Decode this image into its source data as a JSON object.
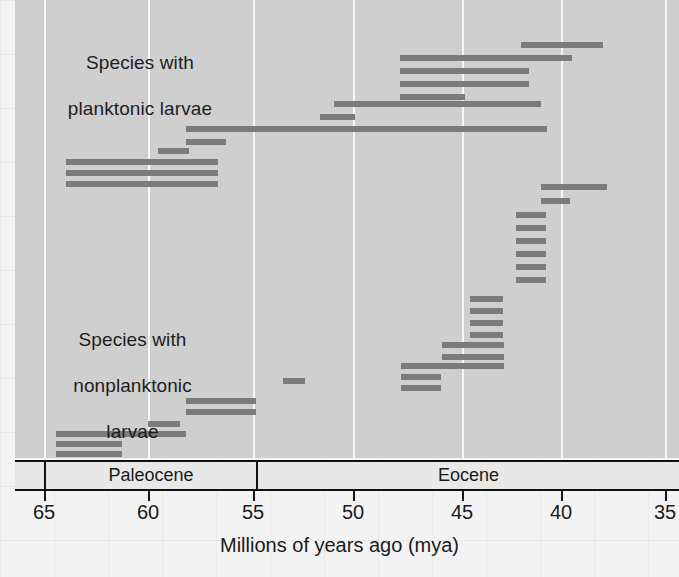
{
  "chart_data": {
    "type": "bar",
    "title": "",
    "xlabel": "Millions of years ago (mya)",
    "ylabel": "",
    "xlim": [
      67.0,
      34.3
    ],
    "x_reversed": true,
    "grid": true,
    "legend_position": "none",
    "tick_values": [
      65,
      60,
      55,
      50,
      45,
      40,
      35
    ],
    "tick_labels": [
      "65",
      "60",
      "55",
      "50",
      "45",
      "40",
      "35"
    ],
    "epochs": [
      {
        "label": "Paleocene",
        "start": 65.5,
        "end": 55.8
      },
      {
        "label": "Eocene",
        "start": 55.8,
        "end": 33.9
      }
    ],
    "group_labels": [
      {
        "text": "Species with\nplanktonic larvae",
        "x_center": 60.2,
        "y_px": 52
      },
      {
        "text": "Species with\nnonplanktonic\nlarvae",
        "x_center": 60.4,
        "y_px": 332
      }
    ],
    "series": [
      {
        "name": "Species with planktonic larvae",
        "bars": [
          {
            "start": 42.1,
            "end": 38.1,
            "row": 0
          },
          {
            "start": 45.9,
            "end": 41.7,
            "row": 1
          },
          {
            "start": 45.9,
            "end": 43.3,
            "row": 2
          },
          {
            "start": 45.9,
            "end": 43.3,
            "row": 3
          },
          {
            "start": 45.9,
            "end": 44.5,
            "row": 4
          },
          {
            "start": 49.0,
            "end": 41.3,
            "row": 5
          },
          {
            "start": 49.6,
            "end": 48.3,
            "row": 6
          },
          {
            "start": 57.3,
            "end": 49.4,
            "row": 7
          },
          {
            "start": 57.9,
            "end": 56.4,
            "row": 8
          },
          {
            "start": 58.9,
            "end": 57.6,
            "row": 9
          },
          {
            "start": 63.6,
            "end": 55.9,
            "row": 10
          },
          {
            "start": 63.7,
            "end": 55.9,
            "row": 11
          },
          {
            "start": 63.8,
            "end": 55.9,
            "row": 12
          }
        ]
      },
      {
        "name": "Species with nonplanktonic larvae",
        "bars": [
          {
            "start": 39.5,
            "end": 37.5,
            "row": 0
          },
          {
            "start": 39.5,
            "end": 38.5,
            "row": 1
          },
          {
            "start": 39.5,
            "end": 38.5,
            "row": 2
          },
          {
            "start": 39.5,
            "end": 38.5,
            "row": 3
          },
          {
            "start": 39.5,
            "end": 38.5,
            "row": 4
          },
          {
            "start": 41.8,
            "end": 40.7,
            "row": 5
          },
          {
            "start": 41.8,
            "end": 40.7,
            "row": 6
          },
          {
            "start": 41.8,
            "end": 40.7,
            "row": 7
          },
          {
            "start": 41.8,
            "end": 40.7,
            "row": 8
          },
          {
            "start": 41.8,
            "end": 40.7,
            "row": 9
          },
          {
            "start": 41.8,
            "end": 40.7,
            "row": 10
          },
          {
            "start": 41.8,
            "end": 40.7,
            "row": 11
          },
          {
            "start": 44.2,
            "end": 41.9,
            "row": 12
          },
          {
            "start": 44.2,
            "end": 41.9,
            "row": 13
          },
          {
            "start": 44.2,
            "end": 41.9,
            "row": 14
          },
          {
            "start": 44.2,
            "end": 41.9,
            "row": 15
          },
          {
            "start": 45.3,
            "end": 42.0,
            "row": 16
          },
          {
            "start": 45.3,
            "end": 42.0,
            "row": 17
          },
          {
            "start": 46.7,
            "end": 42.0,
            "row": 18
          },
          {
            "start": 46.7,
            "end": 44.8,
            "row": 19
          },
          {
            "start": 46.7,
            "end": 44.8,
            "row": 20
          },
          {
            "start": 53.0,
            "end": 52.0,
            "row": 21
          },
          {
            "start": 58.3,
            "end": 56.3,
            "row": 22
          },
          {
            "start": 58.3,
            "end": 56.3,
            "row": 23
          },
          {
            "start": 59.7,
            "end": 58.7,
            "row": 24
          },
          {
            "start": 64.1,
            "end": 59.0,
            "row": 25
          },
          {
            "start": 64.1,
            "end": 61.8,
            "row": 26
          },
          {
            "start": 64.1,
            "end": 61.8,
            "row": 27
          }
        ]
      }
    ],
    "bar_rows_px": {
      "planktonic": [
        45,
        58,
        70,
        82,
        94,
        101,
        113,
        126,
        144,
        156,
        168
      ],
      "nonplanktonic": []
    },
    "bar_color": "#7b7b7b",
    "plot_background": "#cfcfcf"
  },
  "bars_px": [
    {
      "left": 521,
      "width": 82,
      "top": 42
    },
    {
      "left": 400,
      "width": 172,
      "top": 55
    },
    {
      "left": 400,
      "width": 129,
      "top": 68
    },
    {
      "left": 400,
      "width": 129,
      "top": 81
    },
    {
      "left": 400,
      "width": 65,
      "top": 94
    },
    {
      "left": 334,
      "width": 207,
      "top": 101
    },
    {
      "left": 320,
      "width": 35,
      "top": 114
    },
    {
      "left": 186,
      "width": 361,
      "top": 126
    },
    {
      "left": 186,
      "width": 40,
      "top": 139
    },
    {
      "left": 158,
      "width": 31,
      "top": 148
    },
    {
      "left": 66,
      "width": 152,
      "top": 159
    },
    {
      "left": 66,
      "width": 152,
      "top": 170
    },
    {
      "left": 66,
      "width": 152,
      "top": 181
    },
    {
      "left": 541,
      "width": 66,
      "top": 184
    },
    {
      "left": 541,
      "width": 29,
      "top": 198
    },
    {
      "left": 516,
      "width": 30,
      "top": 212
    },
    {
      "left": 516,
      "width": 30,
      "top": 225
    },
    {
      "left": 516,
      "width": 30,
      "top": 238
    },
    {
      "left": 516,
      "width": 30,
      "top": 251
    },
    {
      "left": 516,
      "width": 30,
      "top": 264
    },
    {
      "left": 516,
      "width": 30,
      "top": 277
    },
    {
      "left": 470,
      "width": 33,
      "top": 296
    },
    {
      "left": 470,
      "width": 33,
      "top": 308
    },
    {
      "left": 470,
      "width": 33,
      "top": 320
    },
    {
      "left": 470,
      "width": 33,
      "top": 332
    },
    {
      "left": 442,
      "width": 62,
      "top": 342
    },
    {
      "left": 442,
      "width": 62,
      "top": 354
    },
    {
      "left": 401,
      "width": 103,
      "top": 363
    },
    {
      "left": 401,
      "width": 40,
      "top": 374
    },
    {
      "left": 401,
      "width": 40,
      "top": 385
    },
    {
      "left": 283,
      "width": 22,
      "top": 378
    },
    {
      "left": 186,
      "width": 70,
      "top": 398
    },
    {
      "left": 186,
      "width": 70,
      "top": 409
    },
    {
      "left": 148,
      "width": 32,
      "top": 421
    },
    {
      "left": 56,
      "width": 130,
      "top": 431
    },
    {
      "left": 56,
      "width": 66,
      "top": 441
    },
    {
      "left": 56,
      "width": 66,
      "top": 451
    }
  ],
  "gridlines_px": [
    44,
    148,
    253,
    353,
    462,
    561,
    665
  ],
  "axis": {
    "ticks": [
      {
        "label": "65",
        "x": 44
      },
      {
        "label": "60",
        "x": 148
      },
      {
        "label": "55",
        "x": 253
      },
      {
        "label": "50",
        "x": 353
      },
      {
        "label": "45",
        "x": 462
      },
      {
        "label": "40",
        "x": 561
      },
      {
        "label": "35",
        "x": 665
      }
    ],
    "title": "Millions of years ago (mya)",
    "epochs": [
      {
        "label": "Paleocene",
        "left": 44,
        "width": 212
      },
      {
        "label": "Eocene",
        "left": 256,
        "width": 423
      }
    ]
  },
  "labels": {
    "planktonic_line1": "Species with",
    "planktonic_line2": "planktonic larvae",
    "nonplanktonic_line1": "Species with",
    "nonplanktonic_line2": "nonplanktonic",
    "nonplanktonic_line3": "larvae"
  }
}
